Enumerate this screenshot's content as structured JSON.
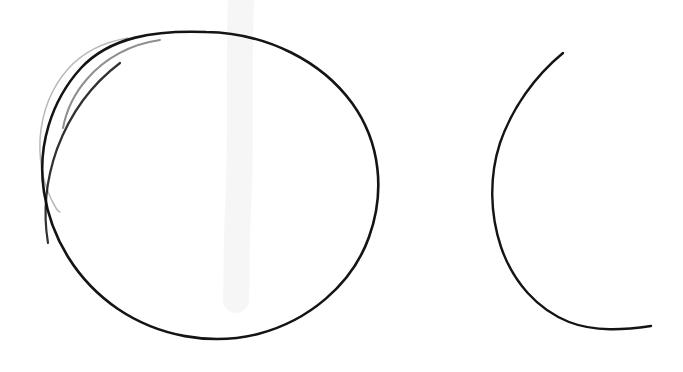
{
  "canvas": {
    "width": 683,
    "height": 372,
    "background_color": "#ffffff",
    "medium": "hand-drawn pencil sketch on white paper",
    "title": "Hand-drawn circle and open arc"
  },
  "palette": {
    "ink_dark": "#141414",
    "ink_mid": "#8e8e8e",
    "ink_faint": "#b9b9b9",
    "paper": "#ffffff",
    "smudge": "#f2f2f2"
  },
  "shapes": [
    {
      "id": "main-circle",
      "label": "Closed hand-drawn circle",
      "type": "closed-curve",
      "stroke_color": "#141414",
      "stroke_width": 2.6,
      "center": {
        "x": 210,
        "y": 185
      },
      "radius_x": 168,
      "radius_y": 153,
      "bounds": {
        "left": 42,
        "top": 32,
        "right": 379,
        "bottom": 338
      },
      "path": "M 206 32 C 268 33 322 62 352 103 C 381 143 385 193 369 237 C 352 285 308 321 258 334 C 210 346 158 336 118 309 C 77 281 51 238 44 192 C 37 147 51 101 81 68 C 110 37 155 30 206 32 Z"
    },
    {
      "id": "ghost-arc",
      "label": "Faint first-attempt arc outside upper-left of circle",
      "type": "open-arc",
      "stroke_color": "#b9b9b9",
      "stroke_width": 1.5,
      "start_point": {
        "x": 128,
        "y": 38
      },
      "end_point": {
        "x": 60,
        "y": 212
      },
      "bounds": {
        "left": 40,
        "top": 36,
        "right": 130,
        "bottom": 214
      },
      "path": "M 128 38 C 104 42 83 52 68 69 C 51 88 42 113 40 139 C 39 163 44 188 56 208 C 58 211 59 212 60 212"
    },
    {
      "id": "ghost-arc-inner",
      "label": "Short grey transitional stroke on circle upper-left",
      "type": "open-arc",
      "stroke_color": "#8e8e8e",
      "stroke_width": 2.0,
      "start_point": {
        "x": 160,
        "y": 40
      },
      "end_point": {
        "x": 63,
        "y": 128
      },
      "bounds": {
        "left": 62,
        "top": 38,
        "right": 162,
        "bottom": 130
      },
      "path": "M 160 40 C 131 44 105 58 87 79 C 73 95 66 112 63 128"
    },
    {
      "id": "right-arc",
      "label": "Open C-shaped arc, left-opening crescent",
      "type": "open-arc",
      "stroke_color": "#141414",
      "stroke_width": 2.4,
      "start_point": {
        "x": 563,
        "y": 53
      },
      "end_point": {
        "x": 651,
        "y": 326
      },
      "leftmost_point": {
        "x": 492,
        "y": 192
      },
      "bounds": {
        "left": 492,
        "top": 51,
        "right": 652,
        "bottom": 328
      },
      "sweep_degrees": 205,
      "path": "M 563 53 C 535 76 512 108 500 143 C 489 177 490 214 501 247 C 513 282 537 309 569 322 C 595 332 624 330 651 326"
    },
    {
      "id": "paper-smudge",
      "label": "Faint vertical scan smudge",
      "type": "artifact",
      "stroke_color": "#f2f2f2",
      "stroke_width": 16,
      "start_point": {
        "x": 240,
        "y": 0
      },
      "end_point": {
        "x": 236,
        "y": 300
      },
      "path": "M 241 0 C 238 70 242 140 238 210 C 236 250 237 275 236 300"
    }
  ],
  "annotations": {
    "shape_count": "2 primary shapes",
    "shape_1_name": "Circle",
    "shape_2_name": "Arc"
  }
}
